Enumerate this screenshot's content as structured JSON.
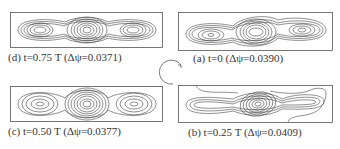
{
  "figure": {
    "panels": [
      {
        "id": "d",
        "caption": "(d) t=0.75 T  (Δψ=0.0371)",
        "time": "0.75 T",
        "delta_psi": "0.0371",
        "position": "top-left"
      },
      {
        "id": "a",
        "caption": "(a) t=0  (Δψ=0.0390)",
        "time": "0",
        "delta_psi": "0.0390",
        "position": "top-right"
      },
      {
        "id": "c",
        "caption": "(c) t=0.50 T  (Δψ=0.0377)",
        "time": "0.50 T",
        "delta_psi": "0.0377",
        "position": "bottom-left"
      },
      {
        "id": "b",
        "caption": "(b) t=0.25 T  (Δψ=0.0409)",
        "time": "0.25 T",
        "delta_psi": "0.0409",
        "position": "bottom-right"
      }
    ],
    "cycle_arrow": "clockwise-cycle-icon",
    "colors": {
      "line": "#444444",
      "background": "#ffffff"
    }
  }
}
